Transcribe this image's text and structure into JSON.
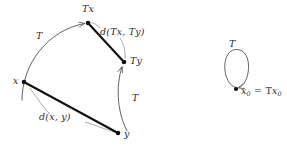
{
  "figure": {
    "background_color": "#ffffff",
    "ink_color": "#2b2b2b",
    "thin_stroke_color": "#5a5a5a",
    "thick_stroke_color": "#111111"
  },
  "labels": {
    "Tx": "Tx",
    "Ty": "Ty",
    "x": "x",
    "y": "y",
    "d_Tx_Ty": "d(Tx, Ty)",
    "d_x_y": "d(x, y)",
    "T_upper": "T",
    "T_lower": "T",
    "T_loop": "T",
    "fixed_point_x": "x",
    "fixed_point_sub": "0",
    "fixed_point_eq": " = T",
    "fixed_point_x2": "x",
    "fixed_point_sub2": "0"
  },
  "points": [
    {
      "name": "x",
      "x": 24,
      "y": 82,
      "label": "x"
    },
    {
      "name": "y",
      "x": 118,
      "y": 133,
      "label": "y"
    },
    {
      "name": "Tx",
      "x": 88,
      "y": 23,
      "label": "Tx"
    },
    {
      "name": "Ty",
      "x": 124,
      "y": 62,
      "label": "Ty"
    },
    {
      "name": "x0",
      "x": 236,
      "y": 89,
      "label": "x0 = Tx0"
    }
  ],
  "edges": [
    {
      "name": "segment-x-y",
      "kind": "thick-segment",
      "from": "x",
      "to": "y",
      "label": "d(x, y)"
    },
    {
      "name": "segment-Tx-Ty",
      "kind": "thick-segment",
      "from": "Tx",
      "to": "Ty",
      "label": "d(Tx, Ty)"
    },
    {
      "name": "map-arrow-x-Tx",
      "kind": "curved-arrow",
      "from": "x",
      "to": "Tx",
      "label": "T"
    },
    {
      "name": "map-arrow-y-Ty",
      "kind": "curved-arrow",
      "from": "y",
      "to": "Ty",
      "label": "T"
    },
    {
      "name": "self-loop-x0",
      "kind": "loop-arrow",
      "from": "x0",
      "to": "x0",
      "label": "T"
    }
  ]
}
